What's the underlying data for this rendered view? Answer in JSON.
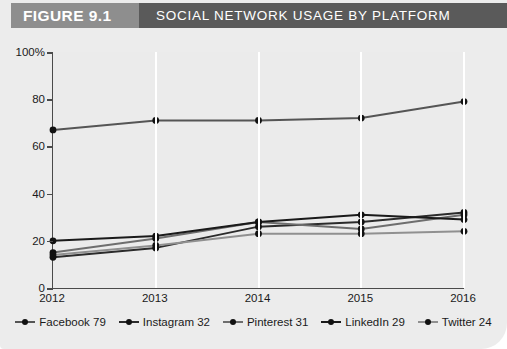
{
  "figure": {
    "label": "FIGURE 9.1",
    "title": "SOCIAL NETWORK USAGE BY PLATFORM"
  },
  "colors": {
    "label_block": "#8e8e8e",
    "title_block": "#5a5a5a",
    "card_background": "#ececec",
    "plot_background": "#ebebeb",
    "gridline": "#ffffff",
    "axis": "#4a4a4a",
    "facebook": "#555555",
    "instagram": "#2b2b2b",
    "pinterest": "#6e6e6e",
    "linkedin": "#1a1a1a",
    "twitter": "#909090"
  },
  "chart_data": {
    "type": "line",
    "title": "SOCIAL NETWORK USAGE BY PLATFORM",
    "xlabel": "",
    "ylabel": "",
    "categories": [
      "2012",
      "2013",
      "2014",
      "2015",
      "2016"
    ],
    "x": [
      2012,
      2013,
      2014,
      2015,
      2016
    ],
    "ylim": [
      0,
      100
    ],
    "yticks": [
      0,
      20,
      40,
      60,
      80,
      100
    ],
    "ytick_labels": [
      "0",
      "20",
      "40",
      "60",
      "80",
      "100%"
    ],
    "grid": "vertical",
    "legend_position": "bottom",
    "series": [
      {
        "name": "Facebook",
        "legend": "Facebook 79",
        "values": [
          67,
          71,
          71,
          72,
          79
        ]
      },
      {
        "name": "Instagram",
        "legend": "Instagram 32",
        "values": [
          13,
          17,
          26,
          28,
          32
        ]
      },
      {
        "name": "Pinterest",
        "legend": "Pinterest 31",
        "values": [
          15,
          21,
          28,
          25,
          31
        ]
      },
      {
        "name": "LinkedIn",
        "legend": "LinkedIn 29",
        "values": [
          20,
          22,
          28,
          31,
          29
        ]
      },
      {
        "name": "Twitter",
        "legend": "Twitter 24",
        "values": [
          14,
          18,
          23,
          23,
          24
        ]
      }
    ]
  }
}
